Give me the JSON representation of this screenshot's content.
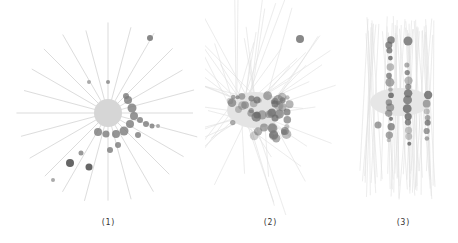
{
  "figure": {
    "panels": [
      {
        "id": "1",
        "caption": "(1)",
        "layout": "radial-star"
      },
      {
        "id": "2",
        "caption": "(2)",
        "layout": "diffuse-cluster"
      },
      {
        "id": "3",
        "caption": "(3)",
        "layout": "vertical-columns"
      }
    ],
    "colors": {
      "edge": "#c8c8c8",
      "node_dark": "#6e6e6e",
      "node_light": "#cfcfcf",
      "hub": "#d8d8d8"
    }
  }
}
